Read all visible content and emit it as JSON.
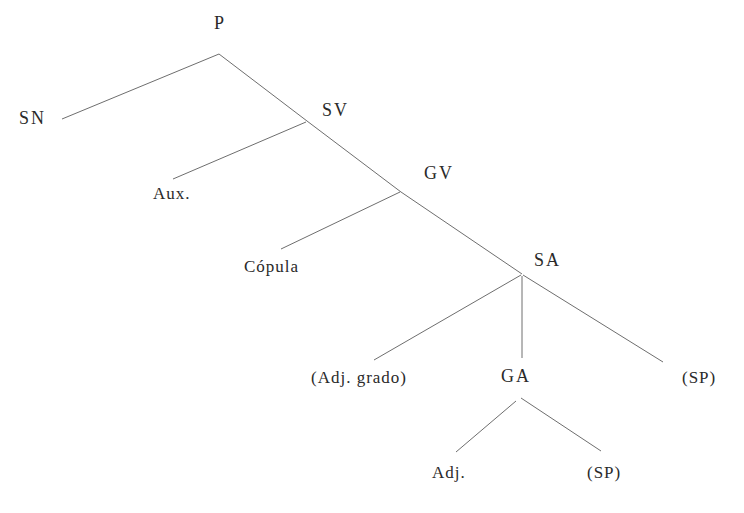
{
  "diagram": {
    "type": "syntactic-tree",
    "line_color": "#6e6e6e",
    "text_color": "#2a2a2a",
    "nodes": {
      "p": {
        "label": "P",
        "x": 214,
        "y": 17
      },
      "sn": {
        "label": "SN",
        "x": 19,
        "y": 110
      },
      "sv": {
        "label": "SV",
        "x": 322,
        "y": 103
      },
      "aux": {
        "label": "Aux.",
        "x": 153,
        "y": 186
      },
      "gv": {
        "label": "GV",
        "x": 424,
        "y": 166
      },
      "copula": {
        "label": "Cópula",
        "x": 244,
        "y": 259
      },
      "sa": {
        "label": "SA",
        "x": 534,
        "y": 253
      },
      "adj_grado": {
        "label": "(Adj. grado)",
        "x": 311,
        "y": 370
      },
      "ga": {
        "label": "GA",
        "x": 501,
        "y": 369
      },
      "sp_right": {
        "label": "(SP)",
        "x": 682,
        "y": 370
      },
      "adj": {
        "label": "Adj.",
        "x": 432,
        "y": 465
      },
      "sp_bottom": {
        "label": "(SP)",
        "x": 587,
        "y": 465
      }
    },
    "edges": [
      {
        "from": "p",
        "to": "sn",
        "x1": 219,
        "y1": 54,
        "x2": 62,
        "y2": 119
      },
      {
        "from": "p",
        "to": "sv",
        "x1": 219,
        "y1": 54,
        "x2": 307,
        "y2": 121
      },
      {
        "from": "sv",
        "to": "aux",
        "x1": 306,
        "y1": 122,
        "x2": 173,
        "y2": 179
      },
      {
        "from": "sv",
        "to": "gv",
        "x1": 307,
        "y1": 121,
        "x2": 401,
        "y2": 192
      },
      {
        "from": "gv",
        "to": "copula",
        "x1": 400,
        "y1": 192,
        "x2": 281,
        "y2": 249
      },
      {
        "from": "gv",
        "to": "sa",
        "x1": 401,
        "y1": 192,
        "x2": 522,
        "y2": 274
      },
      {
        "from": "sa",
        "to": "adj_grado",
        "x1": 521,
        "y1": 275,
        "x2": 374,
        "y2": 360
      },
      {
        "from": "sa",
        "to": "ga",
        "x1": 522,
        "y1": 276,
        "x2": 522,
        "y2": 358
      },
      {
        "from": "sa",
        "to": "sp_right",
        "x1": 523,
        "y1": 275,
        "x2": 663,
        "y2": 362
      },
      {
        "from": "ga",
        "to": "adj",
        "x1": 516,
        "y1": 401,
        "x2": 456,
        "y2": 452
      },
      {
        "from": "ga",
        "to": "sp_bottom",
        "x1": 521,
        "y1": 398,
        "x2": 601,
        "y2": 451
      }
    ]
  }
}
